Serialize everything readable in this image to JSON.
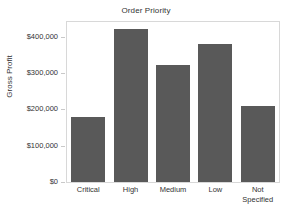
{
  "chart_data": {
    "type": "bar",
    "title": "Order Priority",
    "xlabel": "",
    "ylabel": "Gross Profit",
    "categories": [
      "Critical",
      "High",
      "Medium",
      "Low",
      "Not Specified"
    ],
    "values": [
      178000,
      420000,
      322000,
      380000,
      210000
    ],
    "ylim": [
      0,
      440000
    ],
    "yticks": [
      0,
      100000,
      200000,
      300000,
      400000
    ],
    "ytick_labels": [
      "$0",
      "$100,000",
      "$200,000",
      "$300,000",
      "$400,000"
    ],
    "grid": false,
    "legend": null,
    "series": [
      {
        "name": "Gross Profit",
        "values": [
          178000,
          420000,
          322000,
          380000,
          210000
        ],
        "color": "#595959"
      }
    ],
    "colors": {
      "bar": "#595959",
      "frame": "#d8d8d8",
      "text": "#333333",
      "background": "#ffffff",
      "tick": "#c9c9c9"
    }
  }
}
